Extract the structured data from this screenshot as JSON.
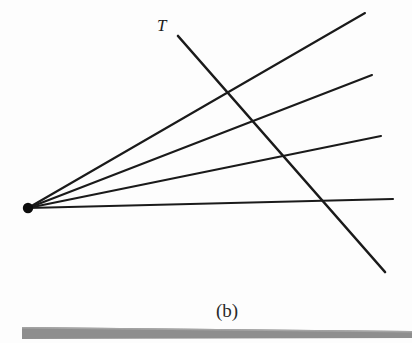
{
  "figure": {
    "caption": "(b)",
    "transversal_label": "T",
    "background_color": "#fdfdfd",
    "line_color": "#1a1a1a",
    "ground_bar_color": "#8e8e8e",
    "ground_bar_highlight_color": "#a4a4a4",
    "vertex": {
      "x": 28,
      "y": 208,
      "radius": 5.2
    },
    "rays": [
      {
        "name": "ray-1",
        "x1": 28,
        "y1": 208,
        "x2": 365,
        "y2": 13
      },
      {
        "name": "ray-2",
        "x1": 28,
        "y1": 208,
        "x2": 372,
        "y2": 75
      },
      {
        "name": "ray-3",
        "x1": 28,
        "y1": 208,
        "x2": 381,
        "y2": 136
      },
      {
        "name": "ray-4",
        "x1": 28,
        "y1": 208,
        "x2": 393,
        "y2": 199
      }
    ],
    "transversal": {
      "name": "transversal-T",
      "x1": 178,
      "y1": 36,
      "x2": 385,
      "y2": 272
    },
    "transversal_label_pos": {
      "x": 157,
      "y": 31
    },
    "caption_pos": {
      "x": 227,
      "y": 317
    },
    "ground_bar": {
      "left_x": 22,
      "right_x": 412,
      "left_top_y": 327,
      "left_bottom_y": 339,
      "right_top_y": 331,
      "right_bottom_y": 338
    }
  }
}
